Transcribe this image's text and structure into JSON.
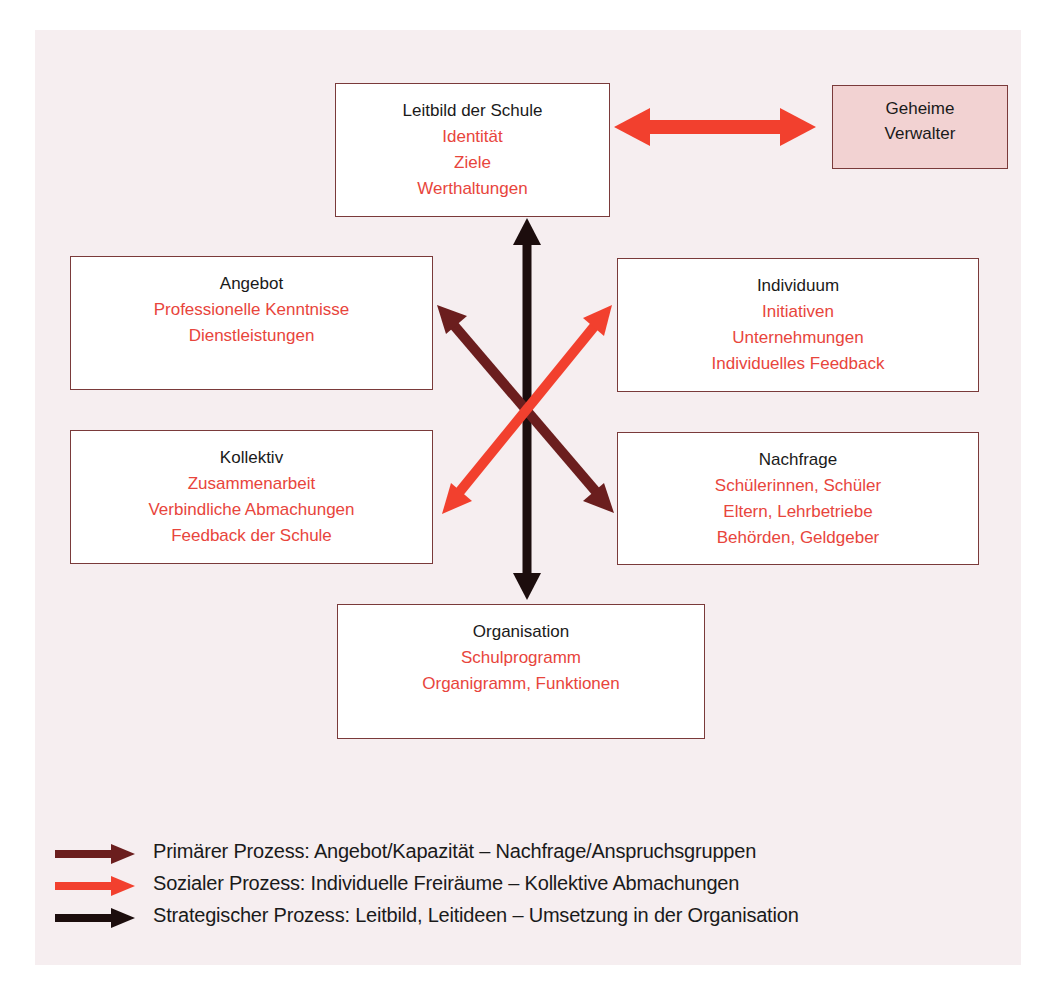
{
  "colors": {
    "background_panel": "#f6eef0",
    "box_border": "#7a3a3a",
    "box_title": "#1a1a1a",
    "box_item": "#e8453c",
    "pink_box_fill": "#f2d2d2",
    "primary_process": "#6b1e1e",
    "social_process": "#f2402e",
    "strategic_process": "#1c0d0d"
  },
  "boxes": {
    "leitbild": {
      "title": "Leitbild der Schule",
      "items": [
        "Identität",
        "Ziele",
        "Werthaltungen"
      ]
    },
    "geheime": {
      "title_line1": "Geheime",
      "title_line2": "Verwalter"
    },
    "angebot": {
      "title": "Angebot",
      "items": [
        "Professionelle Kenntnisse",
        "Dienstleistungen"
      ]
    },
    "individuum": {
      "title": "Individuum",
      "items": [
        "Initiativen",
        "Unternehmungen",
        "Individuelles Feedback"
      ]
    },
    "kollektiv": {
      "title": "Kollektiv",
      "items": [
        "Zusammenarbeit",
        "Verbindliche Abmachungen",
        "Feedback der Schule"
      ]
    },
    "nachfrage": {
      "title": "Nachfrage",
      "items": [
        "Schülerinnen, Schüler",
        "Eltern, Lehrbetriebe",
        "Behörden, Geldgeber"
      ]
    },
    "organisation": {
      "title": "Organisation",
      "items": [
        "Schulprogramm",
        "Organigramm, Funktionen"
      ]
    }
  },
  "arrows": [
    {
      "name": "strategic",
      "from": "Leitbild der Schule",
      "to": "Organisation",
      "bidirectional": true
    },
    {
      "name": "primary",
      "from": "Angebot",
      "to": "Nachfrage",
      "bidirectional": true
    },
    {
      "name": "social",
      "from": "Individuum",
      "to": "Kollektiv",
      "bidirectional": true
    },
    {
      "name": "leitbild-geheime",
      "from": "Leitbild der Schule",
      "to": "Geheime Verwalter",
      "bidirectional": true
    }
  ],
  "legend": [
    {
      "key": "primary",
      "label": "Primärer Prozess: Angebot/Kapazität – Nachfrage/Anspruchsgruppen"
    },
    {
      "key": "social",
      "label": "Sozialer Prozess: Individuelle Freiräume – Kollektive Abmachungen"
    },
    {
      "key": "strategic",
      "label": "Strategischer Prozess: Leitbild, Leitideen – Umsetzung in der Organisation"
    }
  ]
}
